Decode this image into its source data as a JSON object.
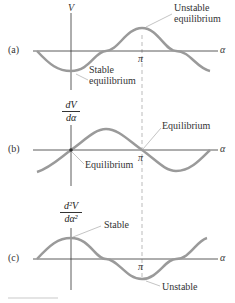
{
  "figure": {
    "panels": [
      {
        "id": "a",
        "tag": "(a)",
        "ylabel": "V",
        "xlabel": "α",
        "pi_label": "π",
        "annotations": [
          {
            "text_line1": "Unstable",
            "text_line2": "equilibrium"
          },
          {
            "text_line1": "Stable",
            "text_line2": "equilibrium"
          }
        ]
      },
      {
        "id": "b",
        "tag": "(b)",
        "ylabel_num": "dV",
        "ylabel_den": "dα",
        "xlabel": "α",
        "pi_label": "π",
        "annotations": [
          {
            "text": "Equilibrium"
          },
          {
            "text": "Equilibrium"
          }
        ]
      },
      {
        "id": "c",
        "tag": "(c)",
        "ylabel_num": "d²V",
        "ylabel_den": "dα²",
        "xlabel": "α",
        "pi_label": "π",
        "annotations": [
          {
            "text": "Stable"
          },
          {
            "text": "Unstable"
          }
        ]
      }
    ],
    "colors": {
      "curve": "#9a9a9a",
      "axis": "#333333",
      "dashed": "#aaaaaa",
      "leader": "#aaaaaa"
    }
  }
}
